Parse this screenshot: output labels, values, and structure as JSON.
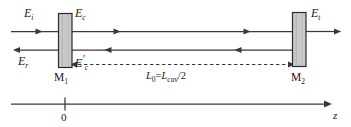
{
  "figure": {
    "kind": "optical-cavity-diagram",
    "colors": {
      "line": "#3a3a3a",
      "mirror_fill": "#c9c9c9",
      "mirror_stroke": "#2b2b2b",
      "text": "#1a1a1a",
      "background": "#ffffff"
    },
    "labels": {
      "incident_field": {
        "symbol": "E",
        "prime": "",
        "subscript": "i"
      },
      "circulating_field": {
        "symbol": "E",
        "prime": "",
        "subscript": "c"
      },
      "circulating_field_return": {
        "symbol": "E",
        "prime": "′",
        "subscript": "c"
      },
      "reflected_field": {
        "symbol": "E",
        "prime": "",
        "subscript": "r"
      },
      "transmitted_field": {
        "symbol": "E",
        "prime": "",
        "subscript": "t"
      },
      "mirror_left": {
        "symbol": "M",
        "subscript": "1"
      },
      "mirror_right": {
        "symbol": "M",
        "subscript": "2"
      },
      "cavity_length": {
        "lhs_symbol": "L",
        "lhs_subscript": "0",
        "equals": "=",
        "rhs_symbol": "L",
        "rhs_subscript": "cav",
        "rhs_divisor": "/2"
      },
      "axis_origin": "0",
      "axis_name": "z"
    }
  }
}
